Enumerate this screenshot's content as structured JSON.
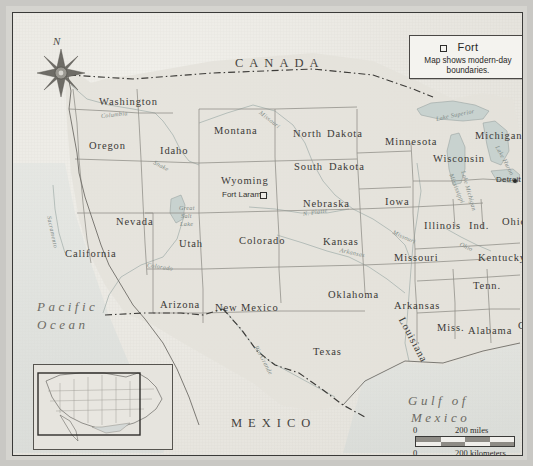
{
  "map": {
    "title_region": "Western United States",
    "legend": {
      "symbol": "fort-square-symbol",
      "title": "Fort",
      "note": "Map shows modern-day boundaries."
    },
    "compass": {
      "north_label": "N"
    },
    "countries": [
      {
        "name": "CANADA",
        "x": 222,
        "y": 44
      },
      {
        "name": "MEXICO",
        "x": 218,
        "y": 404
      }
    ],
    "oceans": [
      {
        "name": "Pacific",
        "x": 24,
        "y": 287
      },
      {
        "name": "Ocean",
        "x": 24,
        "y": 305
      },
      {
        "name": "Gulf of",
        "x": 395,
        "y": 381
      },
      {
        "name": "Mexico",
        "x": 398,
        "y": 398
      }
    ],
    "states": [
      {
        "name": "Washington",
        "x": 86,
        "y": 84,
        "size": "md"
      },
      {
        "name": "Oregon",
        "x": 76,
        "y": 128,
        "size": "md"
      },
      {
        "name": "Idaho",
        "x": 147,
        "y": 133,
        "size": "md"
      },
      {
        "name": "Montana",
        "x": 201,
        "y": 113,
        "size": "md"
      },
      {
        "name": "North",
        "x": 280,
        "y": 116,
        "size": "md"
      },
      {
        "name": "Dakota",
        "x": 314,
        "y": 116,
        "size": "md"
      },
      {
        "name": "South",
        "x": 281,
        "y": 149,
        "size": "md"
      },
      {
        "name": "Dakota",
        "x": 316,
        "y": 149,
        "size": "md"
      },
      {
        "name": "Minnesota",
        "x": 372,
        "y": 124,
        "size": "md"
      },
      {
        "name": "Wisconsin",
        "x": 420,
        "y": 141,
        "size": "md"
      },
      {
        "name": "Michigan",
        "x": 462,
        "y": 118,
        "size": "md"
      },
      {
        "name": "Wyoming",
        "x": 208,
        "y": 163,
        "size": "md"
      },
      {
        "name": "Nebraska",
        "x": 290,
        "y": 186,
        "size": "md"
      },
      {
        "name": "Iowa",
        "x": 372,
        "y": 184,
        "size": "md"
      },
      {
        "name": "Nevada",
        "x": 103,
        "y": 204,
        "size": "md"
      },
      {
        "name": "Utah",
        "x": 166,
        "y": 226,
        "size": "md"
      },
      {
        "name": "Colorado",
        "x": 226,
        "y": 223,
        "size": "md"
      },
      {
        "name": "Kansas",
        "x": 310,
        "y": 224,
        "size": "md"
      },
      {
        "name": "Illinois",
        "x": 411,
        "y": 208,
        "size": "md"
      },
      {
        "name": "Ind.",
        "x": 456,
        "y": 208,
        "size": "md"
      },
      {
        "name": "Ohio",
        "x": 489,
        "y": 204,
        "size": "md"
      },
      {
        "name": "Missouri",
        "x": 381,
        "y": 240,
        "size": "md"
      },
      {
        "name": "Kentucky",
        "x": 465,
        "y": 240,
        "size": "md"
      },
      {
        "name": "California",
        "x": 52,
        "y": 236,
        "size": "md"
      },
      {
        "name": "Arizona",
        "x": 147,
        "y": 287,
        "size": "md"
      },
      {
        "name": "New Mexico",
        "x": 202,
        "y": 290,
        "size": "md"
      },
      {
        "name": "Oklahoma",
        "x": 315,
        "y": 277,
        "size": "md"
      },
      {
        "name": "Arkansas",
        "x": 381,
        "y": 288,
        "size": "md"
      },
      {
        "name": "Tenn.",
        "x": 460,
        "y": 268,
        "size": "md"
      },
      {
        "name": "Miss.",
        "x": 424,
        "y": 310,
        "size": "md"
      },
      {
        "name": "Alabama",
        "x": 455,
        "y": 313,
        "size": "md"
      },
      {
        "name": "Ga.",
        "x": 505,
        "y": 308,
        "size": "md"
      },
      {
        "name": "Texas",
        "x": 300,
        "y": 334,
        "size": "md"
      }
    ],
    "rotated_states": [
      {
        "name": "Louisiana",
        "x": 388,
        "y": 300,
        "rotate": 62
      }
    ],
    "rivers": [
      {
        "name": "Columbia",
        "x": 88,
        "y": 100,
        "rotate": -6
      },
      {
        "name": "Snake",
        "x": 141,
        "y": 146,
        "rotate": 28
      },
      {
        "name": "Sacramento",
        "x": 36,
        "y": 200,
        "rotate": 78
      },
      {
        "name": "Colorado",
        "x": 134,
        "y": 249,
        "rotate": 8
      },
      {
        "name": "Missouri",
        "x": 247,
        "y": 96,
        "rotate": 38
      },
      {
        "name": "N. Platte",
        "x": 290,
        "y": 198,
        "rotate": -9
      },
      {
        "name": "Arkansas",
        "x": 327,
        "y": 234,
        "rotate": 12
      },
      {
        "name": "Missouri",
        "x": 380,
        "y": 216,
        "rotate": 24
      },
      {
        "name": "Ohio",
        "x": 447,
        "y": 228,
        "rotate": 24
      },
      {
        "name": "Rio Grande",
        "x": 243,
        "y": 330,
        "rotate": 62
      },
      {
        "name": "Mississippi",
        "x": 438,
        "y": 158,
        "rotate": 68
      }
    ],
    "lakes": [
      {
        "name": "Great",
        "x": 166,
        "y": 192
      },
      {
        "name": "Salt",
        "x": 168,
        "y": 200
      },
      {
        "name": "Lake",
        "x": 167,
        "y": 208
      },
      {
        "name": "Lake Superior",
        "x": 423,
        "y": 103,
        "rotate": -12
      },
      {
        "name": "Lake Huron",
        "x": 484,
        "y": 130,
        "rotate": 62
      },
      {
        "name": "Lake Michigan",
        "x": 450,
        "y": 155,
        "rotate": 74
      }
    ],
    "cities": [
      {
        "name": "Detroit",
        "x": 483,
        "y": 163,
        "dot_x": 500,
        "dot_y": 166
      }
    ],
    "forts": [
      {
        "name": "Fort Laramie",
        "x": 209,
        "y": 178,
        "sq_x": 247,
        "sq_y": 179
      }
    ],
    "scale": {
      "zero_top": "0",
      "miles": "200 miles",
      "zero_bottom": "0",
      "kilometers": "200 kilometers"
    }
  },
  "colors": {
    "paper": "#eceae4",
    "border_line": "#3a3a38",
    "state_line": "#8e8c86",
    "water": "#c6cfcd",
    "land_shade": "#dcdad3",
    "text": "#3b3a37"
  }
}
